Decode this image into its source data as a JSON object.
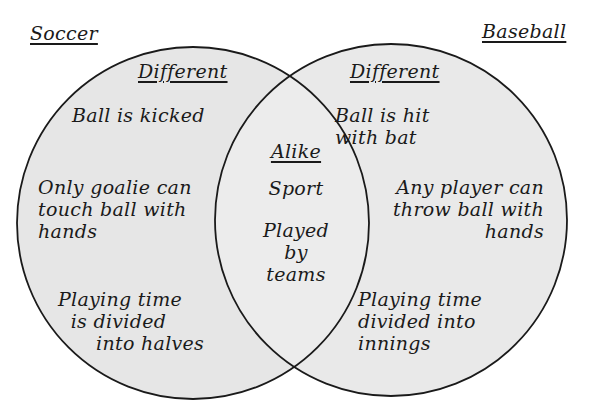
{
  "sets": {
    "left": {
      "name": "Soccer"
    },
    "right": {
      "name": "Baseball"
    }
  },
  "regions": {
    "left_only": {
      "heading": "Different",
      "items": [
        "Ball is kicked",
        "Only goalie can\ntouch ball with\nhands",
        "Playing time\n  is divided\n      into halves"
      ]
    },
    "overlap": {
      "heading": "Alike",
      "items": [
        "Sport",
        "Played\nby\nteams"
      ]
    },
    "right_only": {
      "heading": "Different",
      "items": [
        "Ball is hit\nwith bat",
        "Any player can\nthrow ball with\nhands",
        "Playing time\ndivided into\ninnings"
      ]
    }
  },
  "colors": {
    "circle_fill": "#e6e6e6",
    "overlap_fill": "#ececec",
    "stroke": "#1a1a1a",
    "background": "#ffffff"
  }
}
